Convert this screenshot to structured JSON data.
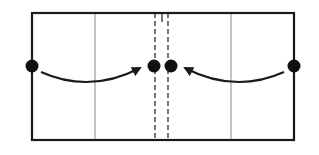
{
  "diagram": {
    "type": "fold-diagram",
    "colors": {
      "stroke": "#1a1a1a",
      "thin": "#8a8a8a",
      "background": "#ffffff"
    },
    "rect": {
      "x": 32,
      "y": 13,
      "w": 262,
      "h": 127
    },
    "thin_lines_x": [
      95,
      231
    ],
    "dashed_lines_x": [
      155,
      168
    ],
    "center_tick": {
      "x": 162,
      "y1": 13,
      "y2": 22
    },
    "dots": [
      {
        "name": "left-edge-dot",
        "x": 32,
        "y": 66
      },
      {
        "name": "center-left-dot",
        "x": 154,
        "y": 66
      },
      {
        "name": "center-right-dot",
        "x": 171,
        "y": 66
      },
      {
        "name": "right-edge-dot",
        "x": 294,
        "y": 66
      }
    ],
    "arrows": [
      {
        "name": "left-fold-arrow",
        "from": "left-edge-dot",
        "to": "center-left-dot"
      },
      {
        "name": "right-fold-arrow",
        "from": "right-edge-dot",
        "to": "center-right-dot"
      }
    ]
  }
}
